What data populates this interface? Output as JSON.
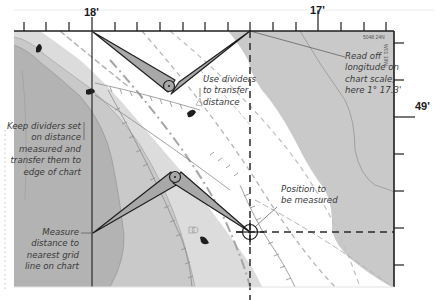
{
  "diagram": {
    "scale_top": {
      "labels": [
        {
          "text": "18'",
          "x": 92
        },
        {
          "text": "17'",
          "x": 318
        }
      ]
    },
    "scale_right": {
      "labels": [
        {
          "text": "49'",
          "y": 108
        }
      ]
    },
    "chart_ref": {
      "top_right": "5048 24N",
      "side": "W01 19W"
    },
    "annotations": {
      "read_off": [
        "Read off",
        "longitude on",
        "chart scale,",
        "here 1° 17.3'"
      ],
      "use_dividers": [
        "Use dividers",
        "to transfer",
        "distance"
      ],
      "keep_dividers": [
        "Keep dividers set",
        "on distance",
        "measured and",
        "transfer them to",
        "edge of chart"
      ],
      "position": [
        "Position to",
        "be measured"
      ],
      "measure": [
        "Measure",
        "distance to",
        "nearest grid",
        "line on chart"
      ]
    },
    "colors": {
      "land_dark": "#b3b3b3",
      "land_mid": "#c9c9c9",
      "land_light": "#dcdcdc",
      "divider_fill": "#a8a8a8",
      "outline": "#1e1e1e",
      "dashed": "#b5b5b5"
    }
  }
}
